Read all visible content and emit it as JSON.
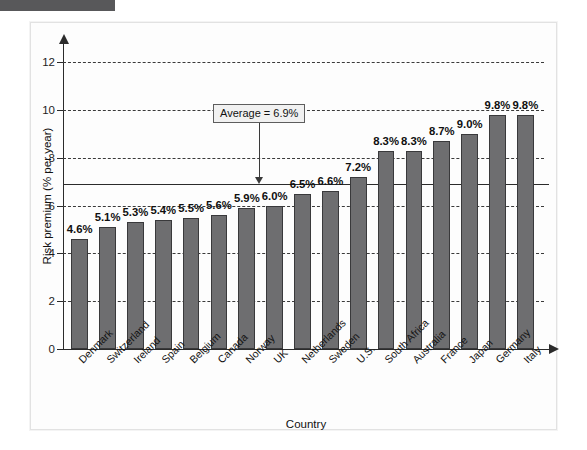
{
  "figure": {
    "tab_marker": "",
    "panel_background": "#fdfdfd",
    "bar_color": "#6e6e70",
    "bar_border_color": "#39393b",
    "axis_color": "#2b2b2b"
  },
  "annotation": {
    "average_text": "Average = 6.9%",
    "average_value": 6.9
  },
  "chart_data": {
    "type": "bar",
    "title": "",
    "xlabel": "Country",
    "ylabel": "Risk premium (% per year)",
    "ylim": [
      0,
      12.8
    ],
    "yticks": [
      0,
      2,
      4,
      6,
      8,
      10,
      12
    ],
    "ytick_labels": [
      "0",
      "2",
      "4",
      "6",
      "8",
      "10",
      "12"
    ],
    "grid": "horizontal-dashed",
    "legend": "none",
    "categories": [
      "Denmark",
      "Switzerland",
      "Ireland",
      "Spain",
      "Belgium",
      "Canada",
      "Norway",
      "UK",
      "Netherlands",
      "Sweden",
      "U.S.",
      "South Africa",
      "Australia",
      "France",
      "Japan",
      "Germany",
      "Italy"
    ],
    "values": [
      4.6,
      5.1,
      5.3,
      5.4,
      5.5,
      5.6,
      5.9,
      6.0,
      6.5,
      6.6,
      7.2,
      8.3,
      8.3,
      8.7,
      9.0,
      9.8,
      9.8
    ],
    "value_labels": [
      "4.6%",
      "5.1%",
      "5.3%",
      "5.4%",
      "5.5%",
      "5.6%",
      "5.9%",
      "6.0%",
      "6.5%",
      "6.6%",
      "7.2%",
      "8.3%",
      "8.3%",
      "8.7%",
      "9.0%",
      "9.8%",
      "9.8%"
    ],
    "annotations": [
      {
        "text": "Average = 6.9%",
        "y": 6.9,
        "type": "hline-with-callout"
      }
    ]
  }
}
